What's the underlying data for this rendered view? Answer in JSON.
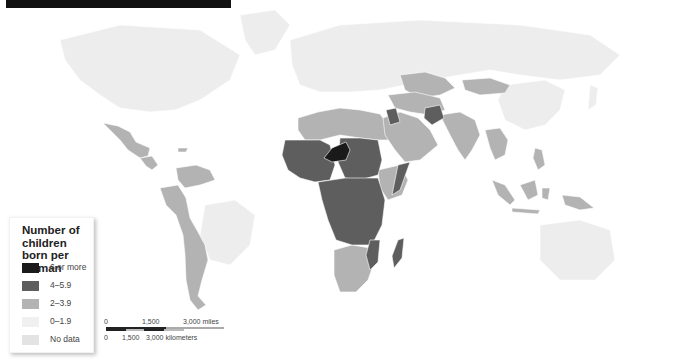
{
  "title_bar": {
    "text": ""
  },
  "legend": {
    "title": "Number of children born per woman",
    "items": [
      {
        "label": "6 or more",
        "color": "#1a1a1a"
      },
      {
        "label": "4–5.9",
        "color": "#5e5e5e"
      },
      {
        "label": "2–3.9",
        "color": "#b3b3b3"
      },
      {
        "label": "0–1.9",
        "color": "#ececec"
      },
      {
        "label": "No data",
        "color": "#e3e3e3"
      }
    ]
  },
  "scale_bar": {
    "miles": {
      "zero": "0",
      "mid": "1,500",
      "max": "3,000 miles"
    },
    "kilometers": {
      "zero": "0",
      "mid": "1,500",
      "max": "3,000 kilometers"
    }
  },
  "colors": {
    "background": "#ffffff",
    "very_high": "#1a1a1a",
    "high": "#5e5e5e",
    "medium": "#b3b3b3",
    "low": "#ececec",
    "no_data": "#e3e3e3"
  },
  "regions": {
    "six_or_more": [
      "Niger"
    ],
    "four_to_5_9": [
      "West Africa",
      "Central Africa",
      "Iraq",
      "Afghanistan",
      "Mozambique",
      "Madagascar",
      "Somalia",
      "Sudan",
      "Mali",
      "Chad"
    ],
    "two_to_3_9": [
      "Mexico",
      "Central America",
      "South America",
      "North Africa",
      "Arabian Peninsula",
      "Southern Africa",
      "Ethiopia",
      "Kenya",
      "Central Asia",
      "India",
      "Mongolia",
      "Southeast Asia",
      "Indonesia",
      "Papua New Guinea"
    ],
    "zero_to_1_9": [
      "North America",
      "Europe",
      "Russia",
      "China",
      "Australia",
      "Brazil"
    ]
  }
}
